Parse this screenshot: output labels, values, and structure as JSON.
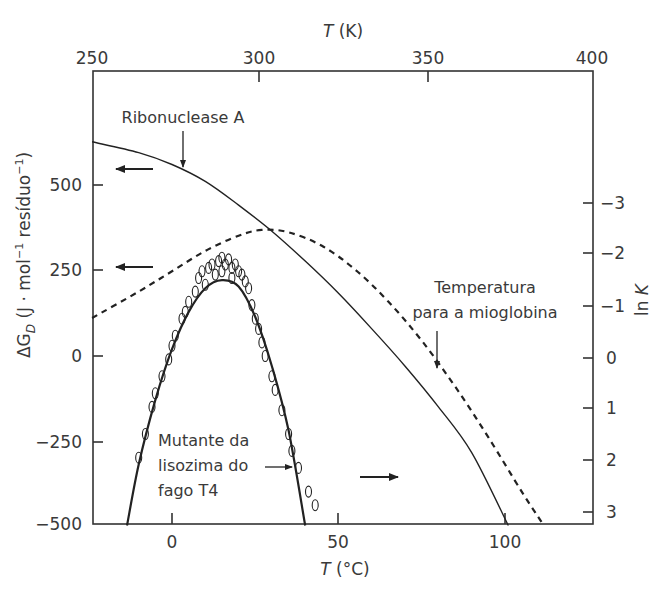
{
  "chart_data": {
    "type": "line",
    "title": "",
    "xlabel": "T (°C)",
    "xlabel_top": "T (K)",
    "ylabel": "ΔG_D (J · mol⁻¹ resíduo⁻¹)",
    "ylabel_right": "ln K",
    "xlim_celsius": [
      -24,
      125
    ],
    "xlim_kelvin": [
      250,
      400
    ],
    "ylim": [
      -500,
      700
    ],
    "ylim_right_lnK": [
      3.2,
      -3.5
    ],
    "x_ticks_bottom": [
      0,
      50,
      100
    ],
    "x_ticks_top": [
      250,
      300,
      350,
      400
    ],
    "y_ticks_left": [
      -500,
      -250,
      0,
      250,
      500
    ],
    "y_ticks_right": [
      -3,
      -2,
      -1,
      0,
      1,
      2,
      3
    ],
    "grid": false,
    "legend": null,
    "series": [
      {
        "name": "Ribonuclease A",
        "style": "solid",
        "x": [
          -24,
          -10,
          0,
          10,
          20,
          30,
          40,
          50,
          60,
          70,
          80,
          90,
          101
        ],
        "values": [
          632,
          600,
          565,
          515,
          445,
          368,
          280,
          185,
          80,
          -30,
          -150,
          -285,
          -500
        ]
      },
      {
        "name": "Temperatura para a mioglobina",
        "style": "dashed",
        "x": [
          -24,
          -10,
          0,
          10,
          20,
          27,
          35,
          45,
          55,
          65,
          75,
          85,
          95,
          105,
          111
        ],
        "values": [
          112,
          190,
          250,
          310,
          355,
          372,
          365,
          325,
          255,
          160,
          45,
          -90,
          -240,
          -400,
          -490
        ]
      },
      {
        "name": "Mutante da lisozima do fago T4",
        "style": "solid-thick",
        "x": [
          -13.5,
          -10,
          -5,
          0,
          5,
          10,
          15,
          20,
          25,
          30,
          35,
          40
        ],
        "values": [
          -500,
          -320,
          -130,
          20,
          130,
          200,
          224,
          205,
          115,
          -30,
          -220,
          -500
        ]
      },
      {
        "name": "Mutante da lisozima do fago T4 (experimental)",
        "style": "open-circles",
        "x": [
          -10,
          -8,
          -6,
          -5,
          -3,
          -1,
          0,
          1,
          3,
          4,
          5,
          7,
          8,
          9,
          10,
          11,
          12,
          13,
          14,
          15,
          15,
          16,
          17,
          18,
          18,
          19,
          20,
          21,
          22,
          23,
          24,
          25,
          26,
          27,
          28,
          30,
          31,
          33,
          35,
          36,
          38,
          41,
          43
        ],
        "values": [
          -300,
          -230,
          -150,
          -110,
          -60,
          -10,
          30,
          60,
          110,
          130,
          160,
          190,
          230,
          250,
          210,
          260,
          270,
          240,
          280,
          290,
          250,
          270,
          285,
          260,
          230,
          270,
          250,
          240,
          220,
          200,
          150,
          110,
          80,
          40,
          0,
          -60,
          -100,
          -160,
          -230,
          -280,
          -330,
          -400,
          -440
        ]
      }
    ],
    "annotations": [
      {
        "text": "Ribonuclease A",
        "arrow": "down"
      },
      {
        "text": "Temperatura para a mioglobina",
        "arrow": "down"
      },
      {
        "text": "Mutante da lisozima do fago T4",
        "arrow": "right"
      },
      {
        "text": "←",
        "meaning": "Ribonuclease A read on left axis"
      },
      {
        "text": "←",
        "meaning": "mioglobina read on left axis"
      },
      {
        "text": "→",
        "meaning": "T4 lysozyme read on right axis (ln K)"
      }
    ]
  },
  "labels": {
    "top_axis_title_T": "T",
    "top_axis_title_unit": " (K)",
    "bottom_axis_title_T": "T",
    "bottom_axis_title_unit": " (°C)",
    "left_axis_prefix": "ΔG",
    "left_axis_sub": "D",
    "left_axis_rest": " (J · mol",
    "left_axis_sup1": "−1",
    "left_axis_mid": " resíduo",
    "left_axis_sup2": "−1",
    "left_axis_end": ")",
    "right_axis_ln": "ln ",
    "right_axis_K": "K",
    "ribonuclease": "Ribonuclease A",
    "myoglobin_line1": "Temperatura",
    "myoglobin_line2": "para a mioglobina",
    "t4_line1": "Mutante da",
    "t4_line2": "lisozima do",
    "t4_line3": "fago T4",
    "top_ticks": [
      "250",
      "300",
      "350",
      "400"
    ],
    "bottom_ticks": [
      "0",
      "50",
      "100"
    ],
    "left_ticks": [
      "500",
      "250",
      "0",
      "−250",
      "−500"
    ],
    "right_ticks": [
      "−3",
      "−2",
      "−1",
      "0",
      "1",
      "2",
      "3"
    ]
  }
}
